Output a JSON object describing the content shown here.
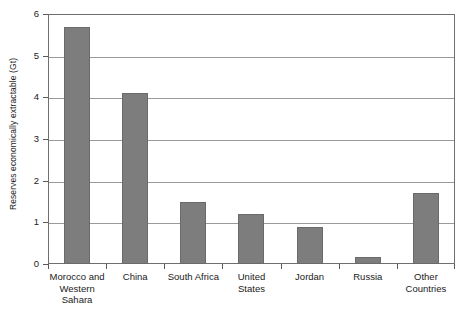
{
  "chart_data": {
    "type": "bar",
    "title": "",
    "xlabel": "",
    "ylabel": "Reserves economically extractable (Gt)",
    "ylim": [
      0,
      6
    ],
    "ytick_values": [
      0,
      1,
      2,
      3,
      4,
      5,
      6
    ],
    "ytick_labels": [
      "0",
      "1",
      "2",
      "3",
      "4",
      "5",
      "6"
    ],
    "grid": "horizontal",
    "legend": "none",
    "bar_color": "#7d7d7d",
    "categories": [
      "Morocco and Western Sahara",
      "China",
      "South Africa",
      "United States",
      "Jordan",
      "Russia",
      "Other Countries"
    ],
    "category_lines": [
      [
        "Morocco and",
        "Western",
        "Sahara"
      ],
      [
        "China"
      ],
      [
        "South Africa"
      ],
      [
        "United",
        "States"
      ],
      [
        "Jordan"
      ],
      [
        "Russia"
      ],
      [
        "Other",
        "Countries"
      ]
    ],
    "values": [
      5.7,
      4.1,
      1.5,
      1.2,
      0.88,
      0.18,
      1.7
    ]
  }
}
